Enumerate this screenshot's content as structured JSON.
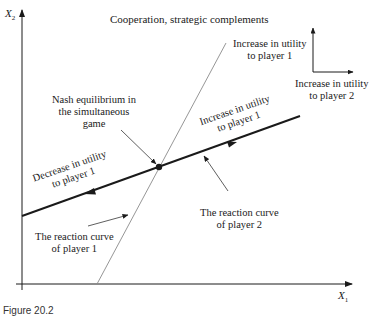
{
  "diagram": {
    "title": "Cooperation, strategic complements",
    "axes": {
      "y_label": "X",
      "y_sub": "2",
      "x_label": "X",
      "x_sub": "1"
    },
    "labels": {
      "increase_p1_top_line1": "Increase in utility",
      "increase_p1_top_line2": "to player 1",
      "increase_p2_line1": "Increase in utility",
      "increase_p2_line2": "to player 2",
      "nash_line1": "Nash equilibrium in",
      "nash_line2": "the simultaneous",
      "nash_line3": "game",
      "increase_along_line1": "Increase in utility",
      "increase_along_line2": "to player 1",
      "decrease_along_line1": "Decrease in utility",
      "decrease_along_line2": "to player 1",
      "reaction_p2_line1": "The reaction curve",
      "reaction_p2_line2": "of player 2",
      "reaction_p1_line1": "The reaction curve",
      "reaction_p1_line2": "of player 1"
    },
    "caption": "Figure 20.2",
    "colors": {
      "ink": "#1a1a1a",
      "thin_curve": "#8a8a8a"
    }
  }
}
